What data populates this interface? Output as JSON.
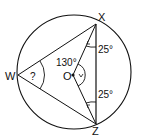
{
  "diagram": {
    "type": "circle-geometry",
    "points": {
      "X": {
        "label": "X",
        "x": 96,
        "y": 24
      },
      "Z": {
        "label": "Z",
        "x": 96,
        "y": 124
      },
      "W": {
        "label": "W",
        "x": 18,
        "y": 75
      },
      "O": {
        "label": "O",
        "x": 73,
        "y": 75
      }
    },
    "angles": {
      "OXZ": "25°",
      "OZX": "25°",
      "XOZ_reflex_label": "130°",
      "W_unknown": "?"
    },
    "stroke_color": "#111111",
    "background": "#ffffff"
  }
}
